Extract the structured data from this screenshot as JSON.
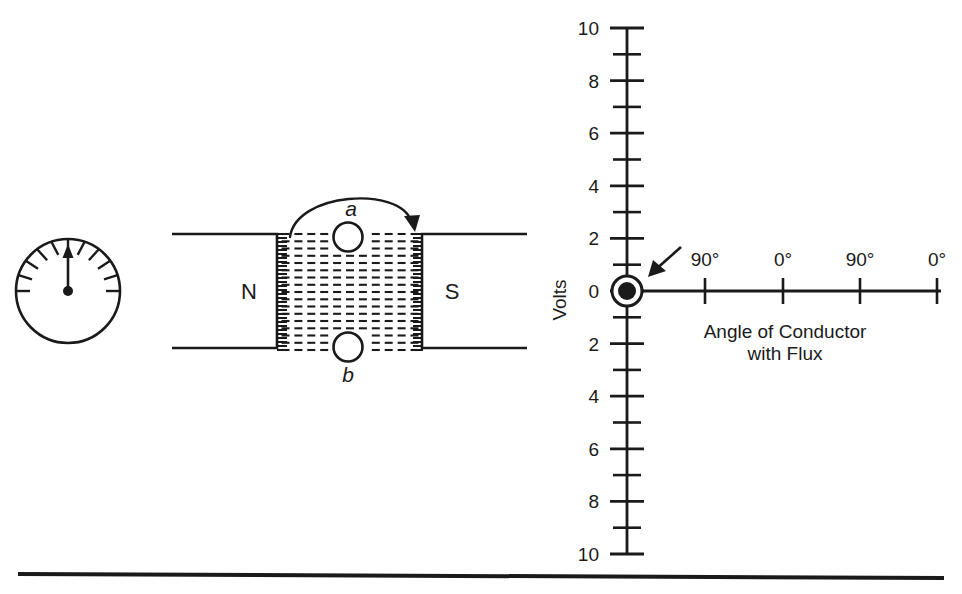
{
  "figure": {
    "ink_color": "#1a1a1a",
    "background": "#ffffff"
  },
  "meter": {
    "name": "analog-voltmeter",
    "needle_direction": "up",
    "tick_count": 11
  },
  "magnet": {
    "north_label": "N",
    "south_label": "S",
    "flux_description": "dashed horizontal flux lines",
    "flux_rows": 17,
    "flux_columns": 11
  },
  "conductors": {
    "top_label": "a",
    "bottom_label": "b",
    "rotation_direction": "clockwise"
  },
  "chart_data": {
    "type": "line",
    "title": "",
    "xlabel": "Angle of Conductor\nwith Flux",
    "xlabel_line1": "Angle of Conductor",
    "xlabel_line2": "with Flux",
    "ylabel": "Volts",
    "ylim": [
      -10,
      10
    ],
    "y_major_ticks": [
      10,
      8,
      6,
      4,
      2,
      0,
      2,
      4,
      6,
      8,
      10
    ],
    "y_major_values": [
      10,
      8,
      6,
      4,
      2,
      0,
      -2,
      -4,
      -6,
      -8,
      -10
    ],
    "y_minor_values": [
      9,
      7,
      5,
      3,
      1,
      -1,
      -3,
      -5,
      -7,
      -9
    ],
    "x_tick_labels": [
      "90°",
      "0°",
      "90°",
      "0°"
    ],
    "x_tick_positions": [
      705,
      783,
      860,
      937
    ],
    "origin_marker": "filled-dot-with-ring",
    "origin_value": 0,
    "series": [
      {
        "name": "voltage",
        "x": [],
        "values": []
      }
    ],
    "annotations": [
      {
        "name": "origin-pointer-arrow",
        "text": "",
        "direction": "down-left",
        "target": "origin"
      }
    ],
    "grid": false,
    "legend": false
  },
  "divider": {
    "name": "bottom-rule"
  }
}
